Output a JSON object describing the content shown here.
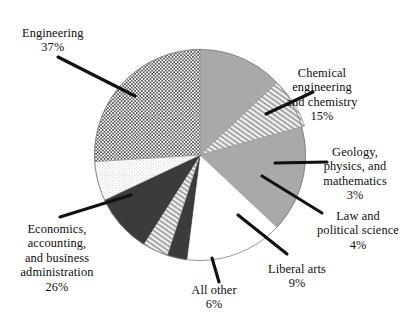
{
  "chart_data": {
    "type": "pie",
    "title": "",
    "subtitle": "",
    "xlabel": "",
    "ylabel": "",
    "legend_position": "none",
    "grid": false,
    "units": "percent",
    "categories": [
      "Engineering",
      "Chemical engineering and chemistry",
      "Geology, physics, and mathematics",
      "Law and political science",
      "Liberal arts",
      "All other",
      "Economics, accounting, and business administration"
    ],
    "values": [
      37,
      15,
      3,
      4,
      9,
      6,
      26
    ],
    "slices": [
      {
        "key": "engineering",
        "label_lines": [
          "Engineering"
        ],
        "value": 37,
        "value_label": "37%",
        "fill_style": "solid-gray",
        "color": "#a9a9a9"
      },
      {
        "key": "chemical",
        "label_lines": [
          "Chemical",
          "engineering",
          "and chemistry"
        ],
        "value": 15,
        "value_label": "15%",
        "fill_style": "diagonal-hatch",
        "color": "#d8d8d8"
      },
      {
        "key": "geology",
        "label_lines": [
          "Geology,",
          "physics, and",
          "mathematics"
        ],
        "value": 3,
        "value_label": "3%",
        "fill_style": "solid-dark",
        "color": "#3b3b3b"
      },
      {
        "key": "law",
        "label_lines": [
          "Law and",
          "political science"
        ],
        "value": 4,
        "value_label": "4%",
        "fill_style": "diagonal-hatch",
        "color": "#d8d8d8"
      },
      {
        "key": "liberal-arts",
        "label_lines": [
          "Liberal arts"
        ],
        "value": 9,
        "value_label": "9%",
        "fill_style": "solid-dark",
        "color": "#3b3b3b"
      },
      {
        "key": "all-other",
        "label_lines": [
          "All other"
        ],
        "value": 6,
        "value_label": "6%",
        "fill_style": "light",
        "color": "#e6e6e6"
      },
      {
        "key": "economics",
        "label_lines": [
          "Economics,",
          "accounting,",
          "and business",
          "administration"
        ],
        "value": 26,
        "value_label": "26%",
        "fill_style": "cross-hatch",
        "color": "#cfcfcf"
      }
    ]
  },
  "labels": {
    "engineering": {
      "l1": "Engineering",
      "pct": "37%"
    },
    "chemical": {
      "l1": "Chemical",
      "l2": "engineering",
      "l3": "and chemistry",
      "pct": "15%"
    },
    "geology": {
      "l1": "Geology,",
      "l2": "physics, and",
      "l3": "mathematics",
      "pct": "3%"
    },
    "law": {
      "l1": "Law and",
      "l2": "political science",
      "pct": "4%"
    },
    "liberal": {
      "l1": "Liberal arts",
      "pct": "9%"
    },
    "allother": {
      "l1": "All other",
      "pct": "6%"
    },
    "economics": {
      "l1": "Economics,",
      "l2": "accounting,",
      "l3": "and business",
      "l4": "administration",
      "pct": "26%"
    }
  }
}
